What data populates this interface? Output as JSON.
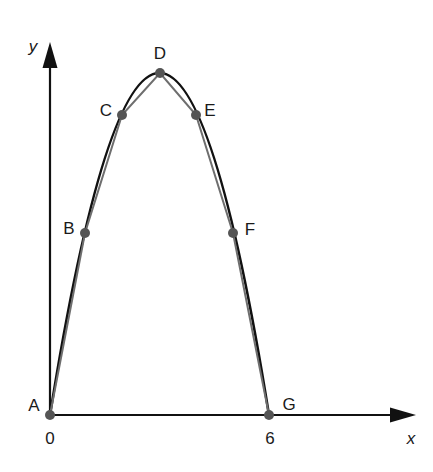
{
  "diagram": {
    "axes": {
      "x_label": "x",
      "y_label": "y",
      "x_ticks": [
        {
          "value": 0,
          "label": "0"
        },
        {
          "value": 6,
          "label": "6"
        }
      ]
    },
    "points": [
      {
        "name": "A",
        "label": "A",
        "x": 0.0,
        "y": 0.0
      },
      {
        "name": "B",
        "label": "B",
        "x": 1.0,
        "y": 0.54
      },
      {
        "name": "C",
        "label": "C",
        "x": 2.0,
        "y": 0.88
      },
      {
        "name": "D",
        "label": "D",
        "x": 3.0,
        "y": 1.0
      },
      {
        "name": "E",
        "label": "E",
        "x": 4.0,
        "y": 0.88
      },
      {
        "name": "F",
        "label": "F",
        "x": 5.0,
        "y": 0.54
      },
      {
        "name": "G",
        "label": "G",
        "x": 6.0,
        "y": 0.0
      }
    ],
    "curve": {
      "type": "parabola",
      "description": "Arch from A through D to G, approximated by polyline A-B-C-D-E-F-G",
      "color": "#111111"
    },
    "polyline": {
      "color": "#6e6e6e"
    },
    "point_color": "#555555",
    "axis_color": "#111111"
  }
}
